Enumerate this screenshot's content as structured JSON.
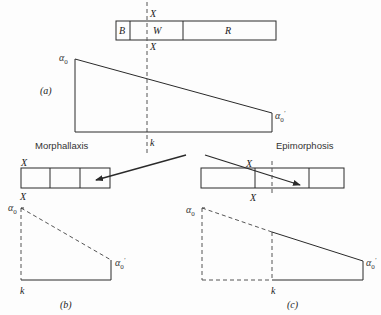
{
  "figure": {
    "top_bar": {
      "segments": [
        "B",
        "W",
        "R"
      ],
      "cut_label_top": "X",
      "cut_label_bottom": "X"
    },
    "panel_a": {
      "label": "(a)",
      "alpha_left": "α",
      "alpha_left_sub": "0",
      "alpha_right": "α",
      "alpha_right_sub": "0",
      "alpha_right_prime": "′",
      "cut_level_label": "k"
    },
    "branches": {
      "left_label": "Morphallaxis",
      "right_label": "Epimorphosis"
    },
    "panel_b": {
      "label": "(b)",
      "bar_label_top": "X",
      "bar_label_bottom": "X",
      "alpha_left": "α",
      "alpha_left_sub": "0",
      "alpha_right": "α",
      "alpha_right_sub": "0",
      "alpha_right_prime": "′",
      "cut_level_label": "k"
    },
    "panel_c": {
      "label": "(c)",
      "bar_label_top": "X",
      "bar_label_bottom": "X",
      "alpha_left": "α",
      "alpha_left_sub": "0",
      "alpha_right": "α",
      "alpha_right_sub": "0",
      "alpha_right_prime": "′",
      "cut_level_label": "k"
    },
    "colors": {
      "line": "#2a2a2a",
      "dashed": "#555555",
      "background": "#fdfdfd"
    }
  }
}
